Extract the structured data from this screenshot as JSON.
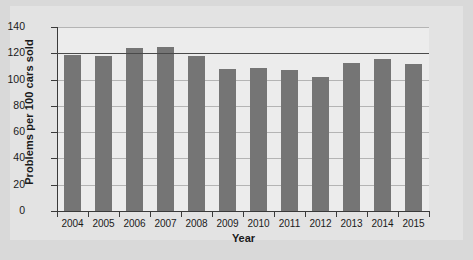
{
  "chart_data": {
    "type": "bar",
    "title": "",
    "xlabel": "Year",
    "ylabel": "Problems per 100 cars sold",
    "categories": [
      "2004",
      "2005",
      "2006",
      "2007",
      "2008",
      "2009",
      "2010",
      "2011",
      "2012",
      "2013",
      "2014",
      "2015"
    ],
    "values": [
      119,
      118,
      124,
      125,
      118,
      108,
      109,
      107,
      102,
      113,
      116,
      112
    ],
    "ylim": [
      0,
      140
    ],
    "yticks": [
      0,
      20,
      40,
      60,
      80,
      100,
      120,
      140
    ],
    "ytick_labels": [
      "0",
      "20",
      "40",
      "60",
      "80",
      "100",
      "120",
      "140"
    ],
    "grid": true,
    "legend": "none",
    "series": [
      {
        "name": "Problems per 100 cars sold",
        "values": [
          119,
          118,
          124,
          125,
          118,
          108,
          109,
          107,
          102,
          113,
          116,
          112
        ]
      }
    ],
    "emphasis_gridline": 120,
    "colors": {
      "bar": "#757575",
      "plot_background": "#ececec",
      "figure_background": "#e3e3e3",
      "page_background": "#d9d9d9",
      "gridline": "#b4b4b4",
      "emphasis_line": "#4a4a4a",
      "axis": "#3a3a3a",
      "text": "#1a1a1a"
    }
  }
}
